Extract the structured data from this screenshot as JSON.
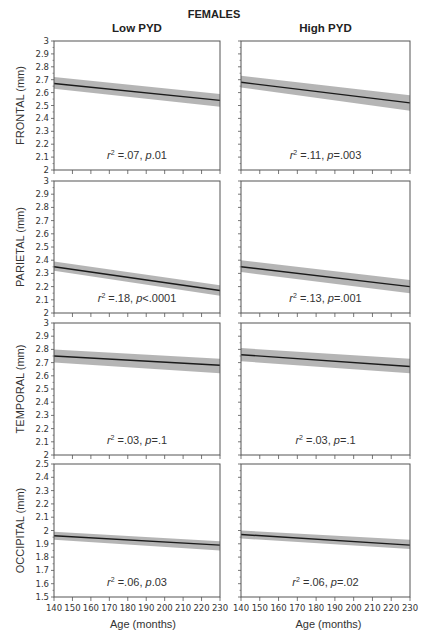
{
  "figure": {
    "title": "FEMALES",
    "columns": [
      "Low PYD",
      "High PYD"
    ],
    "xlabel": "Age (months)"
  },
  "colors": {
    "line": "#1a1a1a",
    "band": "#a8a8a8",
    "axis": "#555555"
  },
  "chart_data": [
    {
      "type": "line",
      "row": "FRONTAL",
      "column": "Low PYD",
      "ylabel": "FRONTAL (mm)",
      "x": [
        140,
        230
      ],
      "y": [
        2.67,
        2.54
      ],
      "ci_lower": [
        2.63,
        2.49
      ],
      "ci_upper": [
        2.72,
        2.59
      ],
      "ylim": [
        2,
        3
      ],
      "yticks": [
        2,
        2.1,
        2.2,
        2.3,
        2.4,
        2.5,
        2.6,
        2.7,
        2.8,
        2.9,
        3
      ],
      "xlim": [
        140,
        230
      ],
      "xticks": [
        140,
        150,
        160,
        170,
        180,
        190,
        200,
        210,
        220,
        230
      ],
      "annotation": {
        "r2": ".07",
        "p_op": "",
        "p": ".01"
      }
    },
    {
      "type": "line",
      "row": "FRONTAL",
      "column": "High PYD",
      "ylabel": "",
      "x": [
        140,
        230
      ],
      "y": [
        2.68,
        2.52
      ],
      "ci_lower": [
        2.64,
        2.46
      ],
      "ci_upper": [
        2.73,
        2.58
      ],
      "ylim": [
        2,
        3
      ],
      "xlim": [
        140,
        230
      ],
      "annotation": {
        "r2": ".11",
        "p_op": "=",
        "p": ".003"
      }
    },
    {
      "type": "line",
      "row": "PARIETAL",
      "column": "Low PYD",
      "ylabel": "PARIETAL (mm)",
      "x": [
        140,
        230
      ],
      "y": [
        2.35,
        2.17
      ],
      "ci_lower": [
        2.32,
        2.13
      ],
      "ci_upper": [
        2.39,
        2.21
      ],
      "ylim": [
        2,
        3
      ],
      "yticks": [
        2,
        2.1,
        2.2,
        2.3,
        2.4,
        2.5,
        2.6,
        2.7,
        2.8,
        2.9,
        3
      ],
      "xlim": [
        140,
        230
      ],
      "annotation": {
        "r2": ".18",
        "p_op": "<",
        "p": ".0001"
      }
    },
    {
      "type": "line",
      "row": "PARIETAL",
      "column": "High PYD",
      "ylabel": "",
      "x": [
        140,
        230
      ],
      "y": [
        2.35,
        2.2
      ],
      "ci_lower": [
        2.31,
        2.15
      ],
      "ci_upper": [
        2.4,
        2.25
      ],
      "ylim": [
        2,
        3
      ],
      "xlim": [
        140,
        230
      ],
      "annotation": {
        "r2": ".13",
        "p_op": "=",
        "p": ".001"
      }
    },
    {
      "type": "line",
      "row": "TEMPORAL",
      "column": "Low PYD",
      "ylabel": "TEMPORAL (mm)",
      "x": [
        140,
        230
      ],
      "y": [
        2.75,
        2.68
      ],
      "ci_lower": [
        2.7,
        2.62
      ],
      "ci_upper": [
        2.8,
        2.73
      ],
      "ylim": [
        2,
        3
      ],
      "yticks": [
        2,
        2.1,
        2.2,
        2.3,
        2.4,
        2.5,
        2.6,
        2.7,
        2.8,
        2.9,
        3
      ],
      "xlim": [
        140,
        230
      ],
      "annotation": {
        "r2": ".03",
        "p_op": "=",
        "p": ".1"
      }
    },
    {
      "type": "line",
      "row": "TEMPORAL",
      "column": "High PYD",
      "ylabel": "",
      "x": [
        140,
        230
      ],
      "y": [
        2.76,
        2.67
      ],
      "ci_lower": [
        2.71,
        2.62
      ],
      "ci_upper": [
        2.81,
        2.73
      ],
      "ylim": [
        2,
        3
      ],
      "xlim": [
        140,
        230
      ],
      "annotation": {
        "r2": ".03",
        "p_op": "=",
        "p": ".1"
      }
    },
    {
      "type": "line",
      "row": "OCCIPITAL",
      "column": "Low PYD",
      "ylabel": "OCCIPITAL (mm)",
      "x": [
        140,
        230
      ],
      "y": [
        1.96,
        1.89
      ],
      "ci_lower": [
        1.93,
        1.85
      ],
      "ci_upper": [
        1.99,
        1.92
      ],
      "ylim": [
        1.5,
        2.5
      ],
      "yticks": [
        1.5,
        1.6,
        1.7,
        1.8,
        1.9,
        2,
        2.1,
        2.2,
        2.3,
        2.4,
        2.5
      ],
      "xlim": [
        140,
        230
      ],
      "annotation": {
        "r2": ".06",
        "p_op": "",
        "p": ".03"
      }
    },
    {
      "type": "line",
      "row": "OCCIPITAL",
      "column": "High PYD",
      "ylabel": "",
      "x": [
        140,
        230
      ],
      "y": [
        1.97,
        1.89
      ],
      "ci_lower": [
        1.94,
        1.86
      ],
      "ci_upper": [
        2.0,
        1.93
      ],
      "ylim": [
        1.5,
        2.5
      ],
      "xlim": [
        140,
        230
      ],
      "annotation": {
        "r2": ".06",
        "p_op": "=",
        "p": ".02"
      }
    }
  ]
}
